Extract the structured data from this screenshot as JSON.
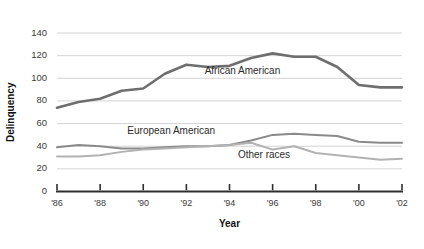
{
  "chart_data": {
    "type": "line",
    "title": "",
    "xlabel": "Year",
    "ylabel": "Delinquency",
    "grid": "horizontal",
    "legend_position": "inline-annotations",
    "xlim": [
      1986,
      2002
    ],
    "ylim": [
      0,
      140
    ],
    "x": [
      1986,
      1987,
      1988,
      1989,
      1990,
      1991,
      1992,
      1993,
      1994,
      1995,
      1996,
      1997,
      1998,
      1999,
      2000,
      2001,
      2002
    ],
    "x_tick_labels": [
      "'86",
      "'88",
      "'90",
      "'92",
      "'94",
      "'96",
      "'98",
      "'00",
      "'02"
    ],
    "x_tick_values": [
      1986,
      1988,
      1990,
      1992,
      1994,
      1996,
      1998,
      2000,
      2002
    ],
    "y_tick_labels": [
      "0",
      "20",
      "40",
      "60",
      "80",
      "100",
      "120",
      "140"
    ],
    "y_tick_values": [
      0,
      20,
      40,
      60,
      80,
      100,
      120,
      140
    ],
    "series": [
      {
        "name": "African American",
        "color": "#6e6e6e",
        "width": 2.6,
        "label_x": 1994.6,
        "label_y": 104,
        "values": [
          74,
          79,
          82,
          89,
          91,
          104,
          112,
          110,
          111,
          118,
          122,
          119,
          119,
          110,
          94,
          92,
          92
        ]
      },
      {
        "name": "European American",
        "color": "#8a8a8a",
        "width": 2.0,
        "label_x": 1991.3,
        "label_y": 51,
        "values": [
          39,
          41,
          40,
          38,
          38,
          39,
          40,
          40,
          41,
          45,
          50,
          51,
          50,
          49,
          44,
          43,
          43
        ]
      },
      {
        "name": "Other races",
        "color": "#b2b2b2",
        "width": 2.0,
        "label_x": 1995.6,
        "label_y": 30,
        "values": [
          31,
          31,
          32,
          35,
          37,
          38,
          39,
          40,
          41,
          43,
          37,
          40,
          34,
          32,
          30,
          28,
          29
        ]
      }
    ]
  },
  "axes": {
    "y_title": "Delinquency",
    "x_title": "Year"
  }
}
